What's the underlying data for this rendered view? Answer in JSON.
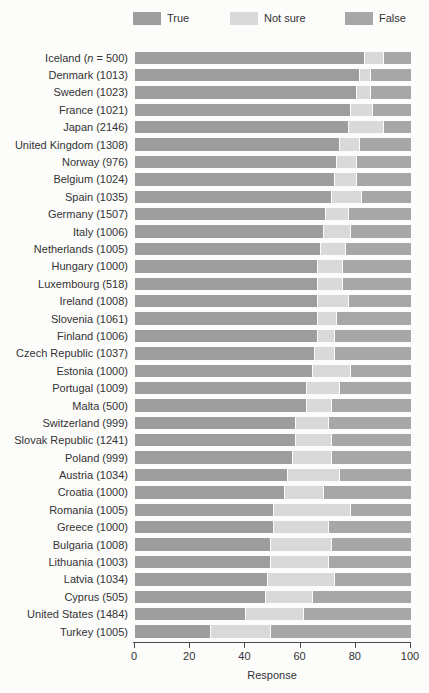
{
  "colors": {
    "true": "#9d9d9d",
    "not_sure": "#d9d9d9",
    "false": "#a7a7a7",
    "background": "#fcfcfb",
    "axis": "#4a4a4a"
  },
  "legend": [
    {
      "label": "True",
      "color": "#9d9d9d"
    },
    {
      "label": "Not sure",
      "color": "#d9d9d9"
    },
    {
      "label": "False",
      "color": "#a7a7a7"
    }
  ],
  "axis": {
    "min": 0,
    "max": 100,
    "ticks": [
      0,
      20,
      40,
      60,
      80,
      100
    ],
    "label": "Response"
  },
  "chart_data": {
    "type": "bar",
    "stacked": true,
    "orientation": "horizontal",
    "title": "",
    "xlabel": "Response",
    "xlim": [
      0,
      100
    ],
    "grid": false,
    "legend_position": "top",
    "series_names": [
      "True",
      "Not sure",
      "False"
    ],
    "rows": [
      {
        "country": "Iceland",
        "n": "500",
        "n_prefix": true,
        "values": [
          83,
          7,
          10
        ]
      },
      {
        "country": "Denmark",
        "n": "1013",
        "n_prefix": false,
        "values": [
          81,
          4,
          15
        ]
      },
      {
        "country": "Sweden",
        "n": "1023",
        "n_prefix": false,
        "values": [
          80,
          5,
          15
        ]
      },
      {
        "country": "France",
        "n": "1021",
        "n_prefix": false,
        "values": [
          78,
          8,
          14
        ]
      },
      {
        "country": "Japan",
        "n": "2146",
        "n_prefix": false,
        "values": [
          77,
          13,
          10
        ]
      },
      {
        "country": "United Kingdom",
        "n": "1308",
        "n_prefix": false,
        "values": [
          74,
          7,
          19
        ]
      },
      {
        "country": "Norway",
        "n": "976",
        "n_prefix": false,
        "values": [
          73,
          7,
          20
        ]
      },
      {
        "country": "Belgium",
        "n": "1024",
        "n_prefix": false,
        "values": [
          72,
          8,
          20
        ]
      },
      {
        "country": "Spain",
        "n": "1035",
        "n_prefix": false,
        "values": [
          71,
          11,
          18
        ]
      },
      {
        "country": "Germany",
        "n": "1507",
        "n_prefix": false,
        "values": [
          69,
          8,
          23
        ]
      },
      {
        "country": "Italy",
        "n": "1006",
        "n_prefix": false,
        "values": [
          68,
          10,
          22
        ]
      },
      {
        "country": "Netherlands",
        "n": "1005",
        "n_prefix": false,
        "values": [
          67,
          9,
          24
        ]
      },
      {
        "country": "Hungary",
        "n": "1000",
        "n_prefix": false,
        "values": [
          66,
          9,
          25
        ]
      },
      {
        "country": "Luxembourg",
        "n": "518",
        "n_prefix": false,
        "values": [
          66,
          9,
          25
        ]
      },
      {
        "country": "Ireland",
        "n": "1008",
        "n_prefix": false,
        "values": [
          66,
          11,
          23
        ]
      },
      {
        "country": "Slovenia",
        "n": "1061",
        "n_prefix": false,
        "values": [
          66,
          7,
          27
        ]
      },
      {
        "country": "Finland",
        "n": "1006",
        "n_prefix": false,
        "values": [
          66,
          6,
          28
        ]
      },
      {
        "country": "Czech Republic",
        "n": "1037",
        "n_prefix": false,
        "values": [
          65,
          7,
          28
        ]
      },
      {
        "country": "Estonia",
        "n": "1000",
        "n_prefix": false,
        "values": [
          64,
          14,
          22
        ]
      },
      {
        "country": "Portugal",
        "n": "1009",
        "n_prefix": false,
        "values": [
          62,
          12,
          26
        ]
      },
      {
        "country": "Malta",
        "n": "500",
        "n_prefix": false,
        "values": [
          62,
          9,
          29
        ]
      },
      {
        "country": "Switzerland",
        "n": "999",
        "n_prefix": false,
        "values": [
          58,
          12,
          30
        ]
      },
      {
        "country": "Slovak Republic",
        "n": "1241",
        "n_prefix": false,
        "values": [
          58,
          13,
          29
        ]
      },
      {
        "country": "Poland",
        "n": "999",
        "n_prefix": false,
        "values": [
          57,
          14,
          29
        ]
      },
      {
        "country": "Austria",
        "n": "1034",
        "n_prefix": false,
        "values": [
          55,
          19,
          26
        ]
      },
      {
        "country": "Croatia",
        "n": "1000",
        "n_prefix": false,
        "values": [
          54,
          14,
          32
        ]
      },
      {
        "country": "Romania",
        "n": "1005",
        "n_prefix": false,
        "values": [
          50,
          28,
          22
        ]
      },
      {
        "country": "Greece",
        "n": "1000",
        "n_prefix": false,
        "values": [
          50,
          20,
          30
        ]
      },
      {
        "country": "Bulgaria",
        "n": "1008",
        "n_prefix": false,
        "values": [
          49,
          22,
          29
        ]
      },
      {
        "country": "Lithuania",
        "n": "1003",
        "n_prefix": false,
        "values": [
          49,
          21,
          30
        ]
      },
      {
        "country": "Latvia",
        "n": "1034",
        "n_prefix": false,
        "values": [
          48,
          24,
          28
        ]
      },
      {
        "country": "Cyprus",
        "n": "505",
        "n_prefix": false,
        "values": [
          47,
          17,
          36
        ]
      },
      {
        "country": "United States",
        "n": "1484",
        "n_prefix": false,
        "values": [
          40,
          21,
          39
        ]
      },
      {
        "country": "Turkey",
        "n": "1005",
        "n_prefix": false,
        "values": [
          27,
          22,
          51
        ]
      }
    ]
  }
}
